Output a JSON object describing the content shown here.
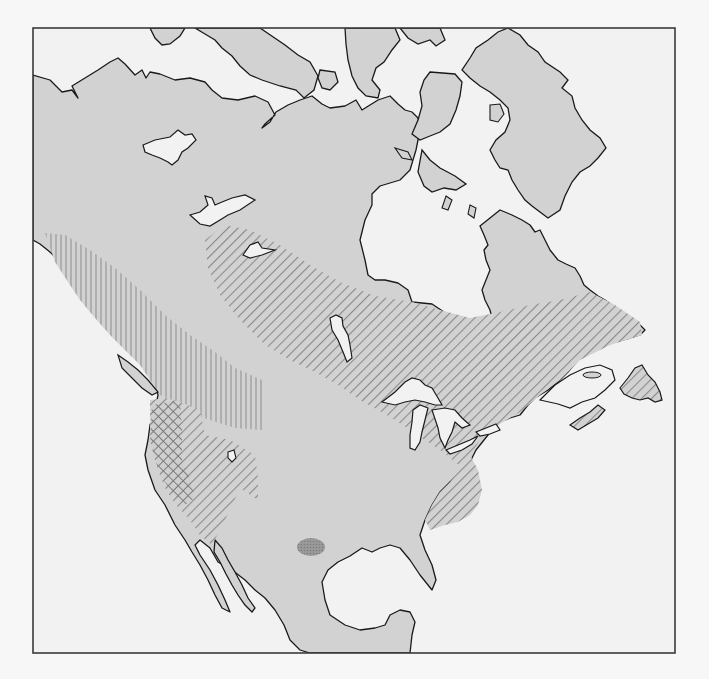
{
  "map": {
    "title": "North America distribution map",
    "subject": "Range map of North America with shaded and hatched zones",
    "colors": {
      "sea": "#f2f2f2",
      "land": "#d2d2d2",
      "coastline": "#1a1a1a",
      "frame": "#3a3a3a",
      "diagonal_hatch": "#8a8a8a",
      "vertical_hatch": "#9a9a9a",
      "crosshatch": "#7a7a7a",
      "dense_spot": "#8f8f8f"
    },
    "regions": [
      {
        "id": "land",
        "label": "North America landmass",
        "style": "solid-gray"
      },
      {
        "id": "boreal-diagonal",
        "label": "Diagonal-hatched zone: Great Lakes / boreal Canada / northeast",
        "style": "diagonal-hatch"
      },
      {
        "id": "west-vertical",
        "label": "Vertical-hatched zone: Pacific Northwest / British Columbia",
        "style": "vertical-hatch"
      },
      {
        "id": "west-diagonal",
        "label": "Diagonal-hatched zone: Great Basin / California interior",
        "style": "diagonal-hatch"
      },
      {
        "id": "west-cross",
        "label": "Cross-hatched zone: Pacific coast (Oregon / northern California)",
        "style": "cross-hatch"
      },
      {
        "id": "southeast-diagonal",
        "label": "Diagonal-hatched zone: Appalachian southeast",
        "style": "diagonal-hatch"
      },
      {
        "id": "texas-spot",
        "label": "Dark stippled spot: west Texas",
        "style": "dark-stipple"
      }
    ],
    "features": [
      "Greenland",
      "Hudson Bay",
      "Great Lakes",
      "Gulf of Mexico",
      "Baja California",
      "Florida",
      "Yucatan Peninsula",
      "Newfoundland",
      "Vancouver Island",
      "Great Bear Lake",
      "Great Slave Lake",
      "Lake Winnipeg",
      "Great Salt Lake",
      "Arctic Archipelago"
    ]
  }
}
